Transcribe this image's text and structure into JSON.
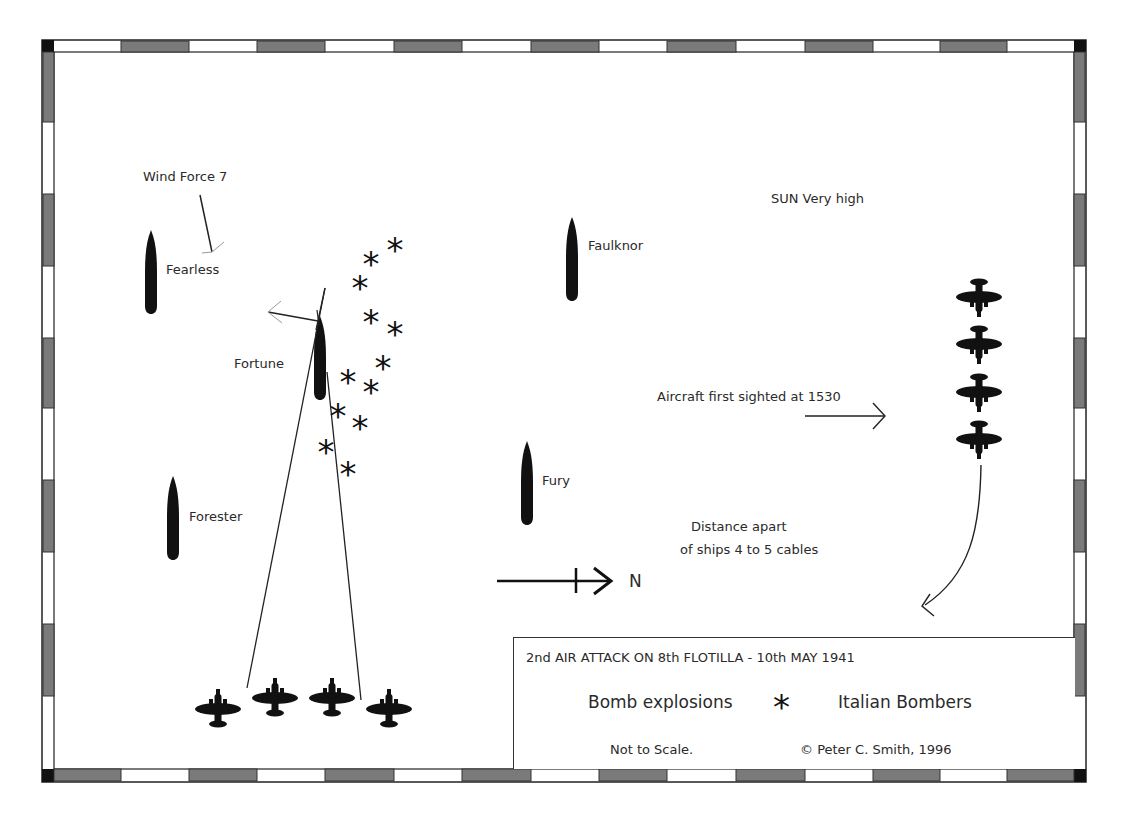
{
  "diagram": {
    "title": "2nd AIR ATTACK ON 8th FLOTILLA - 10th MAY 1941",
    "ships": [
      {
        "name": "Fearless",
        "x": 151,
        "y": 232
      },
      {
        "name": "Fortune",
        "x": 320,
        "y": 322
      },
      {
        "name": "Forester",
        "x": 173,
        "y": 476
      },
      {
        "name": "Faulknor",
        "x": 572,
        "y": 218
      },
      {
        "name": "Fury",
        "x": 527,
        "y": 442
      }
    ],
    "annotations": {
      "wind": "Wind Force 7",
      "sun": "SUN Very high",
      "aircraft_sighted": "Aircraft first sighted at 1530",
      "distance_line1": "Distance apart",
      "distance_line2": "of ships 4 to 5 cables",
      "north": "N"
    },
    "bomb_explosions": [
      [
        395,
        246
      ],
      [
        371,
        260
      ],
      [
        360,
        284
      ],
      [
        371,
        318
      ],
      [
        395,
        330
      ],
      [
        383,
        364
      ],
      [
        348,
        378
      ],
      [
        371,
        388
      ],
      [
        338,
        412
      ],
      [
        360,
        424
      ],
      [
        326,
        448
      ],
      [
        348,
        470
      ]
    ],
    "bomber_formation_attacking": [
      [
        218,
        708
      ],
      [
        275,
        697
      ],
      [
        332,
        697
      ],
      [
        389,
        708
      ]
    ],
    "bomber_formation_incoming": [
      [
        979,
        298
      ],
      [
        979,
        345
      ],
      [
        979,
        393
      ],
      [
        979,
        440
      ]
    ],
    "legend": {
      "title": "2nd AIR ATTACK ON 8th FLOTILLA - 10th MAY 1941",
      "bomb_label": "Bomb explosions",
      "bomb_symbol": "*",
      "bomber_label": "Italian Bombers",
      "scale_note": "Not to Scale.",
      "copyright": "© Peter C. Smith, 1996"
    },
    "colors": {
      "ink": "#111111",
      "border_dark": "#777777",
      "border_light": "#ffffff",
      "text": "#2a2a2a"
    }
  }
}
